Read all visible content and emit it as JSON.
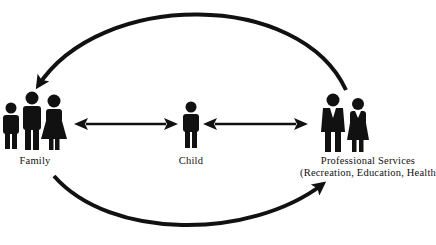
{
  "diagram": {
    "nodes": [
      {
        "id": "family",
        "label": "Family",
        "icon": "family-group-icon"
      },
      {
        "id": "child",
        "label": "Child",
        "icon": "child-icon"
      },
      {
        "id": "professional",
        "label": "Professional Services",
        "sublabel": "(Recreation, Education, Health)",
        "icon": "professionals-icon"
      }
    ],
    "edges": [
      {
        "from": "family",
        "to": "child",
        "type": "bidirectional"
      },
      {
        "from": "child",
        "to": "professional",
        "type": "bidirectional"
      },
      {
        "from": "professional",
        "to": "family",
        "type": "curved-over-top"
      },
      {
        "from": "family",
        "to": "professional",
        "type": "curved-under-bottom"
      }
    ],
    "colors": {
      "ink": "#111111",
      "background": "#ffffff"
    }
  }
}
